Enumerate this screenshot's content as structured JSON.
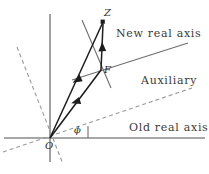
{
  "figure": {
    "type": "geometric-diagram",
    "background_color": "#ffffff",
    "labels": {
      "new_real_axis": "New  real axis",
      "auxiliary": "Auxiliary",
      "old_real_axis": "Old  real axis",
      "point_z": "Z",
      "point_f": "F",
      "origin": "O",
      "angle_phi": "ϕ"
    },
    "colors": {
      "axis": "#8a8a8a",
      "dashed": "#9a9a9a",
      "vector": "#1d1d1d",
      "thin_line": "#6e6e6e",
      "text": "#2b2b2b"
    },
    "geometry": {
      "origin": {
        "x": 50,
        "y": 138
      },
      "point_z": {
        "x": 103,
        "y": 22
      },
      "point_f": {
        "x": 101,
        "y": 70
      },
      "old_real_axis": {
        "x1": 4,
        "y1": 138,
        "x2": 205,
        "y2": 138
      },
      "imaginary_axis": {
        "x1": 50,
        "y1": 14,
        "x2": 50,
        "y2": 162
      },
      "new_real_axis": {
        "x1": 72,
        "y1": 80,
        "x2": 188,
        "y2": 43
      },
      "auxiliary_axis": {
        "x1": 3,
        "y1": 152,
        "x2": 192,
        "y2": 88
      },
      "steep_dashed": {
        "x1": 17,
        "y1": 47,
        "x2": 63,
        "y2": 164
      },
      "f_cross_line": {
        "x1": 82,
        "y1": 20,
        "x2": 111,
        "y2": 88
      },
      "angle_tick": {
        "x": 88,
        "y1": 126,
        "y2": 138
      }
    }
  }
}
